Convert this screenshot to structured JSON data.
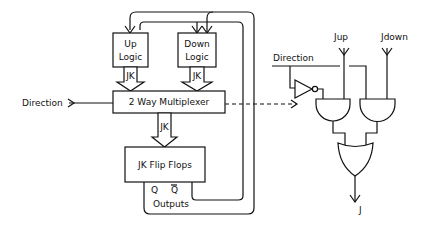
{
  "diagram": {
    "blocks": {
      "up_logic": {
        "line1": "Up",
        "line2": "Logic"
      },
      "down_logic": {
        "line1": "Down",
        "line2": "Logic"
      },
      "multiplexer": "2 Way Multiplexer",
      "flip_flops": "JK Flip Flops"
    },
    "bus_labels": {
      "up_jk": "JK",
      "down_jk": "JK",
      "mux_jk": "JK"
    },
    "outputs": {
      "q": "Q",
      "q_bar": "Q",
      "label": "Outputs"
    },
    "inputs": {
      "direction_left": "Direction"
    },
    "gate_circuit": {
      "direction": "Direction",
      "jup": "Jup",
      "jdown": "Jdown",
      "output": "J"
    }
  }
}
